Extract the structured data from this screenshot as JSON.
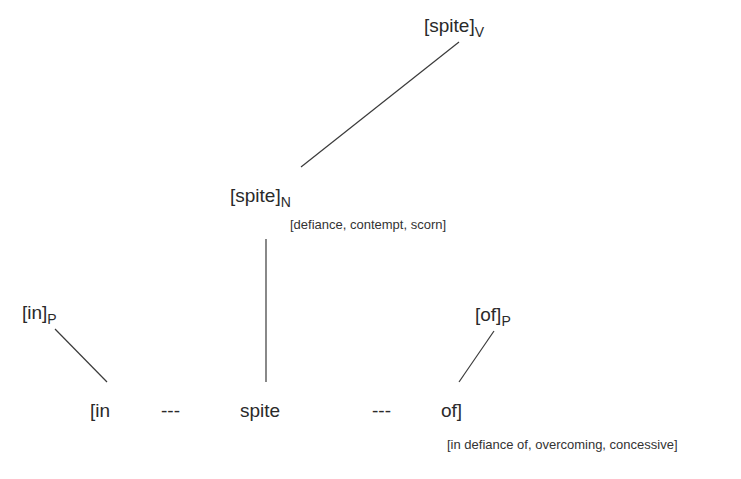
{
  "nodes": {
    "verb": {
      "base": "[spite]",
      "sub": "V"
    },
    "noun": {
      "base": "[spite]",
      "sub": "N",
      "gloss": "[defiance, contempt, scorn]"
    },
    "prep_in": {
      "base": "[in]",
      "sub": "P"
    },
    "prep_of": {
      "base": "[of]",
      "sub": "P"
    }
  },
  "construction": {
    "words": [
      "[in",
      "---",
      "spite",
      "---",
      "of]"
    ],
    "gloss": "[in defiance of, overcoming, concessive]"
  },
  "edges": [
    {
      "from": "verb",
      "to": "noun",
      "x1": 459,
      "y1": 42,
      "x2": 301,
      "y2": 167
    },
    {
      "from": "noun",
      "to": "construction-spite",
      "x1": 266,
      "y1": 239,
      "x2": 266,
      "y2": 382
    },
    {
      "from": "prep_in",
      "to": "construction-in",
      "x1": 55,
      "y1": 329,
      "x2": 107,
      "y2": 382
    },
    {
      "from": "prep_of",
      "to": "construction-of",
      "x1": 494,
      "y1": 331,
      "x2": 459,
      "y2": 382
    }
  ],
  "colors": {
    "text": "#2a2a2a",
    "line": "#3a3a3a",
    "background": "#ffffff"
  }
}
